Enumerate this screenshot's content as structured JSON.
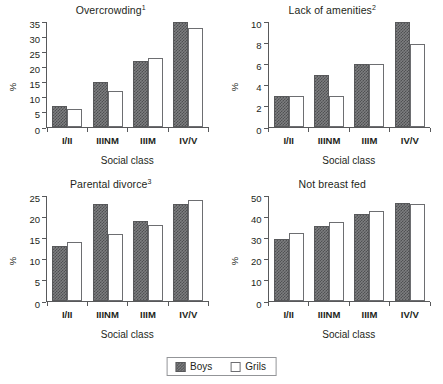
{
  "figure": {
    "legend": {
      "boys_label": "Boys",
      "girls_label": "Grils",
      "boys_swatch": "dark-checkered-fill",
      "girls_swatch": "white-outline-fill"
    },
    "colors": {
      "boys_fill": "#7d7e80",
      "boys_pattern": "#4f5052",
      "girls_fill": "#ffffff",
      "axis": "#58595b",
      "text": "#231f20"
    }
  },
  "chart_data": [
    {
      "type": "bar",
      "title": "Overcrowding",
      "title_superscript": "1",
      "xlabel": "Social class",
      "ylabel": "%",
      "categories": [
        "I/II",
        "IIINM",
        "IIIM",
        "IV/V"
      ],
      "ylim": [
        0,
        35
      ],
      "yticks": [
        0,
        5,
        10,
        15,
        20,
        25,
        30,
        35
      ],
      "grid": false,
      "legend_position": "bottom-center-shared",
      "series": [
        {
          "name": "Boys",
          "values": [
            7,
            15,
            22,
            35
          ]
        },
        {
          "name": "Grils",
          "values": [
            6,
            12,
            23,
            33
          ]
        }
      ]
    },
    {
      "type": "bar",
      "title": "Lack of amenities",
      "title_superscript": "2",
      "xlabel": "Social class",
      "ylabel": "%",
      "categories": [
        "I/II",
        "IIINM",
        "IIIM",
        "IV/V"
      ],
      "ylim": [
        0,
        10
      ],
      "yticks": [
        0,
        2,
        4,
        6,
        8,
        10
      ],
      "grid": false,
      "legend_position": "bottom-center-shared",
      "series": [
        {
          "name": "Boys",
          "values": [
            3,
            5,
            6,
            10
          ]
        },
        {
          "name": "Grils",
          "values": [
            3,
            3,
            6,
            7.9
          ]
        }
      ]
    },
    {
      "type": "bar",
      "title": "Parental divorce",
      "title_superscript": "3",
      "xlabel": "Social class",
      "ylabel": "%",
      "categories": [
        "I/II",
        "IIINM",
        "IIIM",
        "IV/V"
      ],
      "ylim": [
        0,
        25
      ],
      "yticks": [
        0,
        5,
        10,
        15,
        20,
        25
      ],
      "grid": false,
      "legend_position": "bottom-center-shared",
      "series": [
        {
          "name": "Boys",
          "values": [
            13,
            23,
            19,
            23
          ]
        },
        {
          "name": "Grils",
          "values": [
            14,
            16,
            18,
            24
          ]
        }
      ]
    },
    {
      "type": "bar",
      "title": "Not breast fed",
      "title_superscript": "",
      "xlabel": "Social class",
      "ylabel": "%",
      "categories": [
        "I/II",
        "IIINM",
        "IIIM",
        "IV/V"
      ],
      "ylim": [
        0,
        50
      ],
      "yticks": [
        0,
        10,
        20,
        30,
        40,
        50
      ],
      "grid": false,
      "legend_position": "bottom-center-shared",
      "series": [
        {
          "name": "Boys",
          "values": [
            29.7,
            35.7,
            41.6,
            46.5
          ]
        },
        {
          "name": "Grils",
          "values": [
            32.2,
            37.7,
            42.7,
            46.4
          ]
        }
      ]
    }
  ]
}
